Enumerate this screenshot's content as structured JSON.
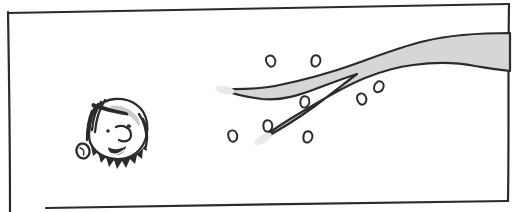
{
  "scene": {
    "type": "hand-drawn comic panel",
    "background": "#ffffff"
  },
  "colors": {
    "ink": "#2b2b2b",
    "paper": "#ffffff",
    "branch_fill": "#d6d6d6",
    "branch_tip_fade": "#e9e9e9",
    "hair_shading": "#cbcbcb",
    "leaf_fill": "#ffffff"
  },
  "panel": {
    "label": "comic panel frame"
  },
  "branch": {
    "label": "gray tree branch entering from right edge, forking into two bare twigs",
    "fork_twig_count": 2
  },
  "leaves": {
    "label": "small leaves shaken loose around the twigs",
    "count": 8,
    "items": [
      {
        "x": 271,
        "y": 61,
        "rot": -25
      },
      {
        "x": 316,
        "y": 61,
        "rot": 10
      },
      {
        "x": 305,
        "y": 102,
        "rot": 5
      },
      {
        "x": 362,
        "y": 99,
        "rot": -20
      },
      {
        "x": 379,
        "y": 87,
        "rot": 25
      },
      {
        "x": 268,
        "y": 126,
        "rot": 0
      },
      {
        "x": 308,
        "y": 137,
        "rot": 10
      },
      {
        "x": 233,
        "y": 136,
        "rot": -15
      }
    ]
  },
  "character": {
    "label": "smiling child head with short dark hair",
    "expression": "smiling",
    "facing": "right"
  }
}
